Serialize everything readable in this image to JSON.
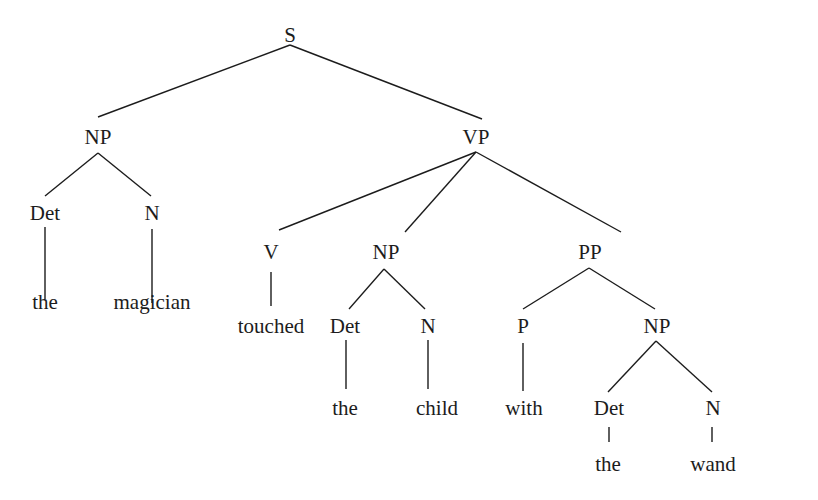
{
  "diagram": {
    "type": "syntax-tree",
    "sentence": "the magician touched the child with the wand",
    "line_color": "#1c1c1c",
    "nodes": {
      "s": {
        "label": "S",
        "x": 290,
        "y": 35
      },
      "np1": {
        "label": "NP",
        "x": 98,
        "y": 137
      },
      "vp": {
        "label": "VP",
        "x": 476,
        "y": 137
      },
      "det1": {
        "label": "Det",
        "x": 45,
        "y": 213
      },
      "n1": {
        "label": "N",
        "x": 152,
        "y": 213
      },
      "the1": {
        "label": "the",
        "x": 45,
        "y": 302
      },
      "magician": {
        "label": "magician",
        "x": 152,
        "y": 302
      },
      "v": {
        "label": "V",
        "x": 271,
        "y": 252
      },
      "touched": {
        "label": "touched",
        "x": 271,
        "y": 326
      },
      "np2": {
        "label": "NP",
        "x": 386,
        "y": 252
      },
      "det2": {
        "label": "Det",
        "x": 345,
        "y": 326
      },
      "n2": {
        "label": "N",
        "x": 428,
        "y": 326
      },
      "the2": {
        "label": "the",
        "x": 345,
        "y": 408
      },
      "child": {
        "label": "child",
        "x": 437,
        "y": 408
      },
      "pp": {
        "label": "PP",
        "x": 590,
        "y": 252
      },
      "p": {
        "label": "P",
        "x": 523,
        "y": 326
      },
      "np3": {
        "label": "NP",
        "x": 657,
        "y": 326
      },
      "with": {
        "label": "with",
        "x": 524,
        "y": 408
      },
      "det3": {
        "label": "Det",
        "x": 609,
        "y": 408
      },
      "n3": {
        "label": "N",
        "x": 713,
        "y": 408
      },
      "the3": {
        "label": "the",
        "x": 608,
        "y": 464
      },
      "wand": {
        "label": "wand",
        "x": 713,
        "y": 464
      }
    },
    "edges": [
      {
        "from": "s",
        "to": "np1",
        "x1": 290,
        "y1": 45,
        "x2": 98,
        "y2": 117
      },
      {
        "from": "s",
        "to": "vp",
        "x1": 290,
        "y1": 45,
        "x2": 482,
        "y2": 119
      },
      {
        "from": "np1",
        "to": "det1",
        "x1": 98,
        "y1": 153,
        "x2": 45,
        "y2": 196
      },
      {
        "from": "np1",
        "to": "n1",
        "x1": 98,
        "y1": 153,
        "x2": 151,
        "y2": 196
      },
      {
        "from": "det1",
        "to": "the1",
        "x1": 45,
        "y1": 227,
        "x2": 45,
        "y2": 299
      },
      {
        "from": "n1",
        "to": "magician",
        "x1": 152,
        "y1": 229,
        "x2": 152,
        "y2": 303
      },
      {
        "from": "vp",
        "to": "v",
        "x1": 476,
        "y1": 152,
        "x2": 279,
        "y2": 230
      },
      {
        "from": "vp",
        "to": "np2",
        "x1": 476,
        "y1": 152,
        "x2": 405,
        "y2": 232
      },
      {
        "from": "vp",
        "to": "pp",
        "x1": 476,
        "y1": 152,
        "x2": 621,
        "y2": 232
      },
      {
        "from": "v",
        "to": "touched",
        "x1": 271,
        "y1": 272,
        "x2": 271,
        "y2": 306
      },
      {
        "from": "np2",
        "to": "det2",
        "x1": 384,
        "y1": 269,
        "x2": 349,
        "y2": 309
      },
      {
        "from": "np2",
        "to": "n2",
        "x1": 384,
        "y1": 269,
        "x2": 425,
        "y2": 309
      },
      {
        "from": "det2",
        "to": "the2",
        "x1": 346,
        "y1": 340,
        "x2": 346,
        "y2": 389
      },
      {
        "from": "n2",
        "to": "child",
        "x1": 428,
        "y1": 340,
        "x2": 428,
        "y2": 389
      },
      {
        "from": "pp",
        "to": "p",
        "x1": 589,
        "y1": 268,
        "x2": 523,
        "y2": 309
      },
      {
        "from": "pp",
        "to": "np3",
        "x1": 589,
        "y1": 268,
        "x2": 655,
        "y2": 309
      },
      {
        "from": "p",
        "to": "with",
        "x1": 523,
        "y1": 343,
        "x2": 523,
        "y2": 391
      },
      {
        "from": "np3",
        "to": "det3",
        "x1": 656,
        "y1": 341,
        "x2": 608,
        "y2": 392
      },
      {
        "from": "np3",
        "to": "n3",
        "x1": 656,
        "y1": 341,
        "x2": 712,
        "y2": 392
      },
      {
        "from": "det3",
        "to": "the3",
        "x1": 609,
        "y1": 427,
        "x2": 609,
        "y2": 442
      },
      {
        "from": "n3",
        "to": "wand",
        "x1": 712,
        "y1": 427,
        "x2": 712,
        "y2": 442
      }
    ]
  }
}
